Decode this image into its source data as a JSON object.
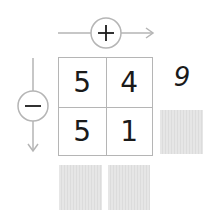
{
  "operators": {
    "horizontal": {
      "symbol": "+",
      "name": "plus",
      "direction": "right"
    },
    "vertical": {
      "symbol": "−",
      "name": "minus",
      "direction": "down"
    }
  },
  "grid": {
    "rows": [
      [
        "5",
        "4"
      ],
      [
        "5",
        "1"
      ]
    ]
  },
  "row_results": [
    "9",
    ""
  ],
  "column_results": [
    "",
    ""
  ],
  "colors": {
    "line": "#b5b5b5",
    "text": "#1a1a1a",
    "answer_box": "#e2e2e2"
  }
}
